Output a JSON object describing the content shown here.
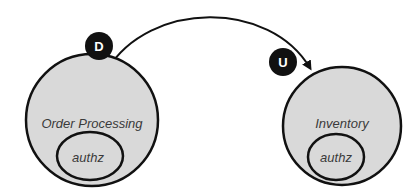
{
  "diagram": {
    "nodes": [
      {
        "id": "order-processing",
        "label": "Order Processing",
        "inner_label": "authz",
        "badge": "D"
      },
      {
        "id": "inventory",
        "label": "Inventory",
        "inner_label": "authz",
        "badge": "U"
      }
    ],
    "edge": {
      "from": "order-processing",
      "to": "inventory",
      "arrow": "end"
    },
    "colors": {
      "circle_fill": "#d9d9d9",
      "stroke": "#111111",
      "badge_fill": "#111111",
      "badge_text": "#ffffff",
      "label": "#3a3a3a"
    }
  }
}
